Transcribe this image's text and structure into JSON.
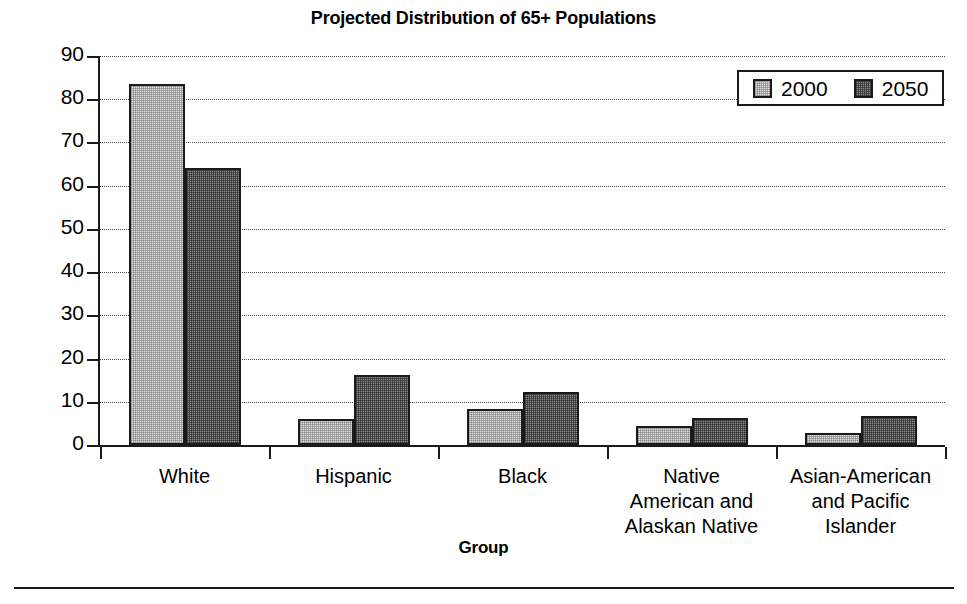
{
  "chart_data": {
    "type": "bar",
    "title": "Projected Distribution of 65+ Populations",
    "xlabel": "Group",
    "ylabel": "Percentage",
    "ylim": [
      0,
      90
    ],
    "yticks": [
      0,
      10,
      20,
      30,
      40,
      50,
      60,
      70,
      80,
      90
    ],
    "ytick_labels": [
      "0",
      "10",
      "20",
      "30",
      "40",
      "50",
      "60",
      "70",
      "80",
      "90"
    ],
    "grid": "horizontal-dotted",
    "legend_position": "top-right",
    "categories": [
      "White",
      "Hispanic",
      "Black",
      "Native American and Alaskan Native",
      "Asian-American and Pacific Islander"
    ],
    "category_lines": [
      [
        "White"
      ],
      [
        "Hispanic"
      ],
      [
        "Black"
      ],
      [
        "Native",
        "American and",
        "Alaskan Native"
      ],
      [
        "Asian-American",
        "and Pacific",
        "Islander"
      ]
    ],
    "series": [
      {
        "name": "2000",
        "color": "#e0e0e0",
        "values": [
          83.5,
          6.0,
          8.3,
          4.3,
          2.8
        ]
      },
      {
        "name": "2050",
        "color": "#8e8e8e",
        "values": [
          64.0,
          16.3,
          12.3,
          6.3,
          6.7
        ]
      }
    ]
  },
  "legend": {
    "entries": [
      {
        "label": "2000",
        "swatch": "light-dotted-swatch"
      },
      {
        "label": "2050",
        "swatch": "dark-dotted-swatch"
      }
    ]
  }
}
